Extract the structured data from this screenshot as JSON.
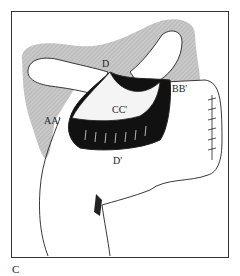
{
  "figure": {
    "panel_label": "C",
    "labels": {
      "d": "D",
      "cc": "CC'",
      "bb": "BB'",
      "aa": "AA'",
      "d_prime": "D'"
    }
  }
}
